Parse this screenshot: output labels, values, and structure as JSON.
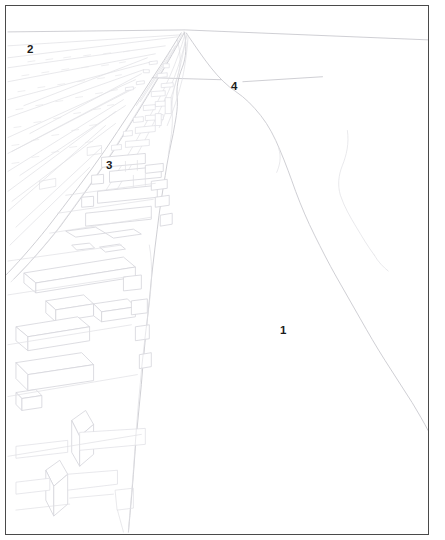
{
  "figure": {
    "type": "perspective-line-drawing",
    "frame_color": "#4a4a4a",
    "line_color": "#d5d5da",
    "strong_line_color": "#c2c2c8",
    "background_color": "#ffffff",
    "label_color": "#1c1c1c"
  },
  "callouts": [
    {
      "id": "callout-1",
      "label": "1",
      "x": 274,
      "y": 319,
      "region": "open water / bay area"
    },
    {
      "id": "callout-2",
      "label": "2",
      "x": 21,
      "y": 38,
      "region": "fields / open land upper left"
    },
    {
      "id": "callout-3",
      "label": "3",
      "x": 100,
      "y": 154,
      "region": "railway and road corridor"
    },
    {
      "id": "callout-4",
      "label": "4",
      "x": 225,
      "y": 75,
      "region": "shoreline / river mouth with leader line"
    }
  ]
}
